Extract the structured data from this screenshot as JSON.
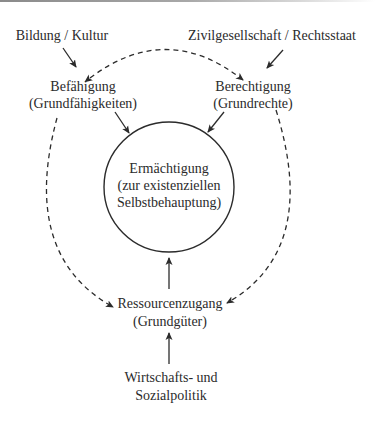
{
  "diagram": {
    "sources": {
      "education": "Bildung / Kultur",
      "civil_society": "Zivilgesellschaft / Rechtsstaat",
      "economic_policy_line1": "Wirtschafts- und",
      "economic_policy_line2": "Sozialpolitik"
    },
    "nodes": {
      "capability": {
        "title": "Befähigung",
        "subtitle": "(Grundfähigkeiten)"
      },
      "entitlement": {
        "title": "Berechtigung",
        "subtitle": "(Grundrechte)"
      },
      "empowerment": {
        "line1": "Ermächtigung",
        "line2": "(zur existenziellen",
        "line3": "Selbstbehauptung)"
      },
      "resource_access": {
        "title": "Ressourcenzugang",
        "subtitle": "(Grundgüter)"
      }
    },
    "edges": [
      {
        "from": "Bildung / Kultur",
        "to": "Befähigung",
        "style": "solid"
      },
      {
        "from": "Zivilgesellschaft / Rechtsstaat",
        "to": "Berechtigung",
        "style": "solid"
      },
      {
        "from": "Befähigung",
        "to": "Ermächtigung",
        "style": "solid"
      },
      {
        "from": "Berechtigung",
        "to": "Ermächtigung",
        "style": "solid"
      },
      {
        "from": "Ressourcenzugang",
        "to": "Ermächtigung",
        "style": "solid"
      },
      {
        "from": "Wirtschafts- und Sozialpolitik",
        "to": "Ressourcenzugang",
        "style": "solid"
      },
      {
        "from": "Befähigung",
        "to": "Berechtigung",
        "style": "dashed",
        "bidirectional": true
      },
      {
        "from": "Befähigung",
        "to": "Ressourcenzugang",
        "style": "dashed"
      },
      {
        "from": "Berechtigung",
        "to": "Ressourcenzugang",
        "style": "dashed"
      }
    ],
    "colors": {
      "ink": "#2b2b2b",
      "background": "#ffffff"
    }
  }
}
